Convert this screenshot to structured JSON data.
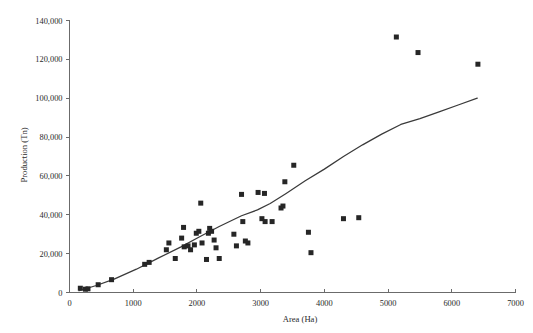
{
  "chart_data": {
    "type": "scatter",
    "title": "",
    "xlabel": "Area (Ha)",
    "ylabel": "Production (Tn)",
    "xlim": [
      0,
      7000
    ],
    "ylim": [
      0,
      140000
    ],
    "xticks": [
      0,
      1000,
      2000,
      3000,
      4000,
      5000,
      6000,
      7000
    ],
    "yticks": [
      0,
      20000,
      40000,
      60000,
      80000,
      100000,
      120000,
      140000
    ],
    "xtick_labels": [
      "0",
      "1000",
      "2000",
      "3000",
      "4000",
      "5000",
      "6000",
      "7000"
    ],
    "ytick_labels": [
      "0",
      "20,000",
      "40,000",
      "60,000",
      "80,000",
      "100,000",
      "120,000",
      "140,000"
    ],
    "grid": false,
    "legend": false,
    "marker": "square",
    "marker_color": "#262626",
    "series": [
      {
        "name": "Area vs Production",
        "points": [
          [
            170,
            2200
          ],
          [
            250,
            1700
          ],
          [
            290,
            1900
          ],
          [
            450,
            4000
          ],
          [
            660,
            6600
          ],
          [
            1180,
            14500
          ],
          [
            1250,
            15500
          ],
          [
            1520,
            22000
          ],
          [
            1560,
            25500
          ],
          [
            1660,
            17500
          ],
          [
            1760,
            28000
          ],
          [
            1790,
            33500
          ],
          [
            1800,
            23500
          ],
          [
            1860,
            24000
          ],
          [
            1900,
            22000
          ],
          [
            1960,
            24500
          ],
          [
            1990,
            30500
          ],
          [
            2030,
            31500
          ],
          [
            2060,
            46000
          ],
          [
            2080,
            25500
          ],
          [
            2150,
            17000
          ],
          [
            2180,
            30500
          ],
          [
            2200,
            33000
          ],
          [
            2230,
            31500
          ],
          [
            2270,
            27000
          ],
          [
            2300,
            23000
          ],
          [
            2350,
            17500
          ],
          [
            2580,
            30000
          ],
          [
            2620,
            24000
          ],
          [
            2700,
            50500
          ],
          [
            2720,
            36500
          ],
          [
            2760,
            26500
          ],
          [
            2800,
            25500
          ],
          [
            2960,
            51500
          ],
          [
            3020,
            38000
          ],
          [
            3060,
            51000
          ],
          [
            3070,
            36500
          ],
          [
            3180,
            36500
          ],
          [
            3320,
            43500
          ],
          [
            3350,
            44500
          ],
          [
            3380,
            57000
          ],
          [
            3520,
            65500
          ],
          [
            3750,
            31000
          ],
          [
            3790,
            20500
          ],
          [
            4300,
            38000
          ],
          [
            4540,
            38500
          ],
          [
            5130,
            131500
          ],
          [
            5470,
            123500
          ],
          [
            6410,
            117500
          ]
        ]
      }
    ],
    "trend_line": {
      "name": "fitted trend line",
      "points": [
        [
          150,
          900
        ],
        [
          420,
          3600
        ],
        [
          700,
          6900
        ],
        [
          1050,
          12000
        ],
        [
          1400,
          17800
        ],
        [
          1750,
          23500
        ],
        [
          2050,
          28800
        ],
        [
          2350,
          34000
        ],
        [
          2700,
          39500
        ],
        [
          2950,
          42500
        ],
        [
          3150,
          45800
        ],
        [
          3400,
          51000
        ],
        [
          3700,
          57500
        ],
        [
          4000,
          63500
        ],
        [
          4300,
          70000
        ],
        [
          4600,
          76000
        ],
        [
          4900,
          81500
        ],
        [
          5200,
          86500
        ],
        [
          5500,
          89500
        ],
        [
          5800,
          93000
        ],
        [
          6100,
          96500
        ],
        [
          6400,
          100000
        ]
      ]
    }
  },
  "axes": {
    "y_title": "Production (Tn)",
    "x_title": "Area (Ha)"
  }
}
